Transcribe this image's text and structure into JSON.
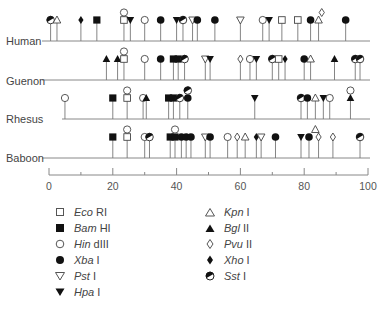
{
  "chart_data": {
    "type": "restriction-map",
    "title": "",
    "xlabel": "",
    "x_ticks": [
      0,
      20,
      40,
      60,
      80,
      100
    ],
    "x_minor_ticks": [
      10,
      30,
      50,
      70,
      90
    ],
    "xlim": [
      0,
      100
    ],
    "rows": [
      {
        "label": "Human",
        "sites": [
          {
            "x": 0.5,
            "enzyme": "Sst I"
          },
          {
            "x": 2.5,
            "enzyme": "Kpn I"
          },
          {
            "x": 10,
            "enzyme": "Xho I"
          },
          {
            "x": 15,
            "enzyme": "Bam HI"
          },
          {
            "x": 23.5,
            "enzyme": "Eco RI"
          },
          {
            "x": 23.5,
            "enzyme": "Hin dIII",
            "stack": 1
          },
          {
            "x": 25.5,
            "enzyme": "Hpa I"
          },
          {
            "x": 30,
            "enzyme": "Hin dIII"
          },
          {
            "x": 35,
            "enzyme": "Xba I"
          },
          {
            "x": 40,
            "enzyme": "Hpa I"
          },
          {
            "x": 42,
            "enzyme": "Sst I"
          },
          {
            "x": 45,
            "enzyme": "Pst I"
          },
          {
            "x": 46.5,
            "enzyme": "Xba I"
          },
          {
            "x": 52,
            "enzyme": "Xba I"
          },
          {
            "x": 60,
            "enzyme": "Pst I"
          },
          {
            "x": 67,
            "enzyme": "Hin dIII"
          },
          {
            "x": 69,
            "enzyme": "Hpa I"
          },
          {
            "x": 73,
            "enzyme": "Eco RI"
          },
          {
            "x": 78,
            "enzyme": "Eco RI"
          },
          {
            "x": 82,
            "enzyme": "Xba I"
          },
          {
            "x": 84.5,
            "enzyme": "Kpn I"
          },
          {
            "x": 85.5,
            "enzyme": "Pvu II",
            "stack": 1
          },
          {
            "x": 93,
            "enzyme": "Xba I"
          }
        ]
      },
      {
        "label": "Guenon",
        "sites": [
          {
            "x": 18,
            "enzyme": "Bgl II"
          },
          {
            "x": 21.5,
            "enzyme": "Bgl II"
          },
          {
            "x": 23.5,
            "enzyme": "Eco RI"
          },
          {
            "x": 23.5,
            "enzyme": "Hin dIII",
            "stack": 1
          },
          {
            "x": 30,
            "enzyme": "Hin dIII"
          },
          {
            "x": 35,
            "enzyme": "Xba I"
          },
          {
            "x": 39,
            "enzyme": "Bam HI"
          },
          {
            "x": 40.5,
            "enzyme": "Bam HI"
          },
          {
            "x": 42.5,
            "enzyme": "Sst I"
          },
          {
            "x": 49,
            "enzyme": "Pst I"
          },
          {
            "x": 50.5,
            "enzyme": "Hpa I"
          },
          {
            "x": 60,
            "enzyme": "Pvu II"
          },
          {
            "x": 63,
            "enzyme": "Hin dIII"
          },
          {
            "x": 65,
            "enzyme": "Hpa I"
          },
          {
            "x": 70,
            "enzyme": "Sst I"
          },
          {
            "x": 72,
            "enzyme": "Eco RI"
          },
          {
            "x": 74,
            "enzyme": "Xho I"
          },
          {
            "x": 80,
            "enzyme": "Xba I"
          },
          {
            "x": 82,
            "enzyme": "Kpn I"
          },
          {
            "x": 89.5,
            "enzyme": "Bgl II"
          },
          {
            "x": 96,
            "enzyme": "Sst I"
          },
          {
            "x": 97.5,
            "enzyme": "Sst I"
          }
        ]
      },
      {
        "label": "Rhesus",
        "sites": [
          {
            "x": 5,
            "enzyme": "Hin dIII"
          },
          {
            "x": 20,
            "enzyme": "Bam HI"
          },
          {
            "x": 24.5,
            "enzyme": "Eco RI"
          },
          {
            "x": 24.5,
            "enzyme": "Hin dIII",
            "stack": 1
          },
          {
            "x": 29.5,
            "enzyme": "Hin dIII"
          },
          {
            "x": 30.5,
            "enzyme": "Bgl II"
          },
          {
            "x": 37.5,
            "enzyme": "Bam HI"
          },
          {
            "x": 39,
            "enzyme": "Bam HI"
          },
          {
            "x": 41,
            "enzyme": "Sst I"
          },
          {
            "x": 43.5,
            "enzyme": "Xba I"
          },
          {
            "x": 43.5,
            "enzyme": "Sst I",
            "stack": 1
          },
          {
            "x": 64.5,
            "enzyme": "Hpa I"
          },
          {
            "x": 79,
            "enzyme": "Sst I"
          },
          {
            "x": 81,
            "enzyme": "Xba I"
          },
          {
            "x": 83.5,
            "enzyme": "Kpn I"
          },
          {
            "x": 86,
            "enzyme": "Hpa I"
          },
          {
            "x": 88,
            "enzyme": "Hin dIII"
          },
          {
            "x": 94.5,
            "enzyme": "Bgl II"
          },
          {
            "x": 94.5,
            "enzyme": "Hin dIII",
            "stack": 1
          }
        ]
      },
      {
        "label": "Baboon",
        "sites": [
          {
            "x": 20,
            "enzyme": "Bam HI"
          },
          {
            "x": 24.5,
            "enzyme": "Eco RI"
          },
          {
            "x": 24.5,
            "enzyme": "Hin dIII",
            "stack": 1
          },
          {
            "x": 30,
            "enzyme": "Hin dIII"
          },
          {
            "x": 31.5,
            "enzyme": "Sst I"
          },
          {
            "x": 38,
            "enzyme": "Bam HI"
          },
          {
            "x": 39.5,
            "enzyme": "Bam HI"
          },
          {
            "x": 39.5,
            "enzyme": "Hin dIII",
            "stack": 1
          },
          {
            "x": 41.5,
            "enzyme": "Xba I"
          },
          {
            "x": 43,
            "enzyme": "Xba I"
          },
          {
            "x": 44.5,
            "enzyme": "Xba I"
          },
          {
            "x": 49,
            "enzyme": "Pst I"
          },
          {
            "x": 50.5,
            "enzyme": "Xba I"
          },
          {
            "x": 56,
            "enzyme": "Hin dIII"
          },
          {
            "x": 59,
            "enzyme": "Pvu II"
          },
          {
            "x": 61.5,
            "enzyme": "Kpn I"
          },
          {
            "x": 65,
            "enzyme": "Xho I"
          },
          {
            "x": 66.5,
            "enzyme": "Pst I"
          },
          {
            "x": 71,
            "enzyme": "Xba I"
          },
          {
            "x": 79,
            "enzyme": "Hpa I"
          },
          {
            "x": 81.5,
            "enzyme": "Xba I"
          },
          {
            "x": 83.5,
            "enzyme": "Kpn I",
            "stack": 1
          },
          {
            "x": 84.5,
            "enzyme": "Pvu II"
          },
          {
            "x": 89,
            "enzyme": "Pvu II"
          },
          {
            "x": 97.5,
            "enzyme": "Sst I"
          }
        ]
      }
    ],
    "legend": [
      {
        "symbol": "open-square",
        "enzyme": "Eco",
        "suffix": "RI"
      },
      {
        "symbol": "filled-square",
        "enzyme": "Bam",
        "suffix": "HI"
      },
      {
        "symbol": "open-circle",
        "enzyme": "Hin",
        "suffix": "dIII"
      },
      {
        "symbol": "filled-circle",
        "enzyme": "Xba",
        "suffix": "I"
      },
      {
        "symbol": "open-down-triangle",
        "enzyme": "Pst",
        "suffix": "I"
      },
      {
        "symbol": "filled-down-triangle",
        "enzyme": "Hpa",
        "suffix": "I"
      },
      {
        "symbol": "open-up-triangle",
        "enzyme": "Kpn",
        "suffix": "I"
      },
      {
        "symbol": "filled-up-triangle",
        "enzyme": "Bgl",
        "suffix": "II"
      },
      {
        "symbol": "open-diamond",
        "enzyme": "Pvu",
        "suffix": "II"
      },
      {
        "symbol": "filled-diamond",
        "enzyme": "Xho",
        "suffix": "I"
      },
      {
        "symbol": "half-circle",
        "enzyme": "Sst",
        "suffix": "I"
      }
    ]
  },
  "labels": {
    "human": "Human",
    "guenon": "Guenon",
    "rhesus": "Rhesus",
    "baboon": "Baboon"
  },
  "axis": {
    "t0": "0",
    "t20": "20",
    "t40": "40",
    "t60": "60",
    "t80": "80",
    "t100": "100"
  },
  "legend_col1": [
    {
      "enzyme": "Eco",
      "suffix": "RI"
    },
    {
      "enzyme": "Bam",
      "suffix": "HI"
    },
    {
      "enzyme": "Hin",
      "suffix": "dIII"
    },
    {
      "enzyme": "Xba",
      "suffix": "I"
    },
    {
      "enzyme": "Pst",
      "suffix": "I"
    },
    {
      "enzyme": "Hpa",
      "suffix": "I"
    }
  ],
  "legend_col2": [
    {
      "enzyme": "Kpn",
      "suffix": "I"
    },
    {
      "enzyme": "Bgl",
      "suffix": "II"
    },
    {
      "enzyme": "Pvu",
      "suffix": "II"
    },
    {
      "enzyme": "Xho",
      "suffix": "I"
    },
    {
      "enzyme": "Sst",
      "suffix": "I"
    }
  ]
}
